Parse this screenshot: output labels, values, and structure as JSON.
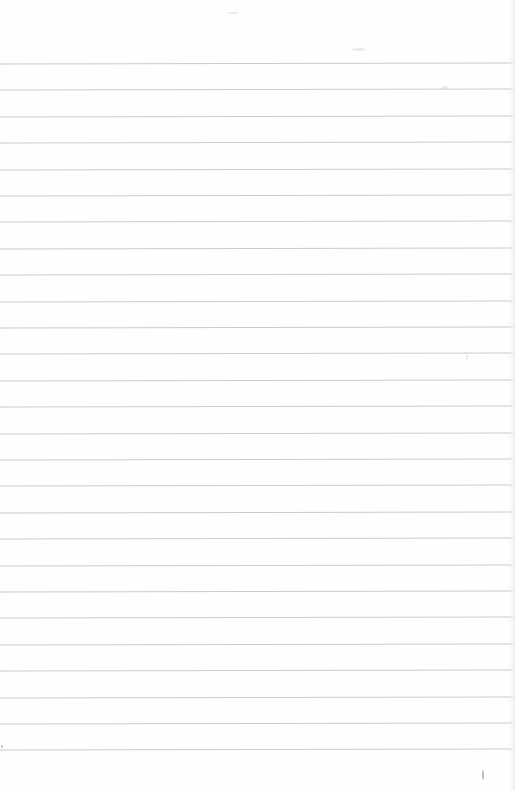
{
  "page": {
    "type": "lined-notebook-paper",
    "background_color": "#fefefe",
    "rule_color": "#c9cbcf",
    "rule_count": 27,
    "first_rule_y": 63,
    "rule_spacing": 26.4,
    "content_text": ""
  }
}
